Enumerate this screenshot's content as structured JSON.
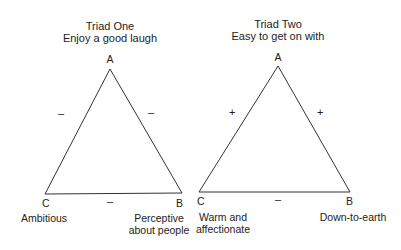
{
  "triads": [
    {
      "title": "Triad One",
      "subtitle": "Enjoy a good laugh",
      "vertices": {
        "A": {
          "label": "A",
          "x": 110,
          "y": 69
        },
        "B": {
          "label": "B",
          "x": 182,
          "y": 193,
          "caption": [
            "Perceptive",
            "about people"
          ]
        },
        "C": {
          "label": "C",
          "x": 45,
          "y": 194,
          "caption": [
            "Ambitious"
          ]
        }
      },
      "edges": {
        "AC": "–",
        "AB": "–",
        "CB": "–"
      }
    },
    {
      "title": "Triad Two",
      "subtitle": "Easy to get on with",
      "vertices": {
        "A": {
          "label": "A",
          "x": 278,
          "y": 66
        },
        "B": {
          "label": "B",
          "x": 350,
          "y": 192,
          "caption": [
            "Down-to-earth"
          ]
        },
        "C": {
          "label": "C",
          "x": 199,
          "y": 192,
          "caption": [
            "Warm and",
            "affectionate"
          ]
        }
      },
      "edges": {
        "AC": "+",
        "AB": "+",
        "CB": "–"
      }
    }
  ],
  "colors": {
    "line": "#333333",
    "text": "#222222"
  }
}
